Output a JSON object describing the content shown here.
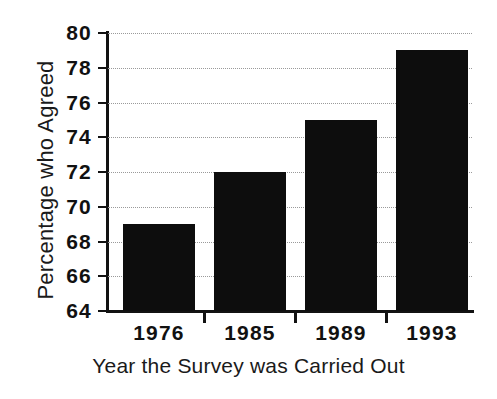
{
  "chart_data": {
    "type": "bar",
    "title": "",
    "subtitle": "",
    "xlabel": "Year the Survey was Carried Out",
    "ylabel": "Percentage who Agreed",
    "categories": [
      "1976",
      "1985",
      "1989",
      "1993"
    ],
    "values": [
      69,
      72,
      75,
      79
    ],
    "ylim": [
      64,
      80
    ],
    "ytick_values": [
      64,
      66,
      68,
      70,
      72,
      74,
      76,
      78,
      80
    ],
    "ytick_labels": [
      "64",
      "66",
      "68",
      "70",
      "72",
      "74",
      "76",
      "78",
      "80"
    ],
    "ytick_step": 2,
    "grid": true,
    "grid_style": "dotted",
    "grid_color": "#9a9a9a",
    "grid_axis": "y",
    "legend": false,
    "legend_position": "none",
    "bar_color": "#0d0d0d",
    "axis_color": "#121212",
    "background_color": "#ffffff",
    "series": [
      {
        "name": "Percentage who Agreed",
        "values": [
          69,
          72,
          75,
          79
        ]
      }
    ],
    "annotations": []
  }
}
